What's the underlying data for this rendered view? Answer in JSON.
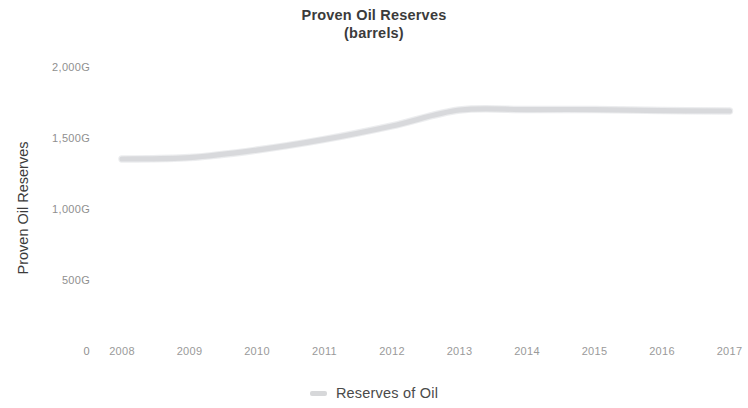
{
  "chart_data": {
    "type": "line",
    "title": "Proven Oil Reserves",
    "subtitle": "(barrels)",
    "xlabel": "",
    "ylabel": "Proven Oil Reserves",
    "categories": [
      "2008",
      "2009",
      "2010",
      "2011",
      "2012",
      "2013",
      "2014",
      "2015",
      "2016",
      "2017"
    ],
    "x": [
      2008,
      2009,
      2010,
      2011,
      2012,
      2013,
      2014,
      2015,
      2016,
      2017
    ],
    "series": [
      {
        "name": "Reserves of Oil",
        "color": "#d7d8da",
        "values": [
          1352,
          1362,
          1415,
          1490,
          1585,
          1697,
          1700,
          1700,
          1693,
          1690
        ]
      }
    ],
    "ylim": [
      0,
      2000
    ],
    "ytick_values": [
      0,
      500,
      1000,
      1500,
      2000
    ],
    "ytick_labels": [
      "0",
      "500G",
      "1,000G",
      "1,500G",
      "2,000G"
    ],
    "grid": false,
    "legend_position": "bottom",
    "legend_entries": [
      "Reserves of Oil"
    ],
    "value_suffix": "G",
    "background_color": "#ffffff",
    "title_color": "#3b3b3b",
    "tick_color": "#9a9a9a"
  }
}
